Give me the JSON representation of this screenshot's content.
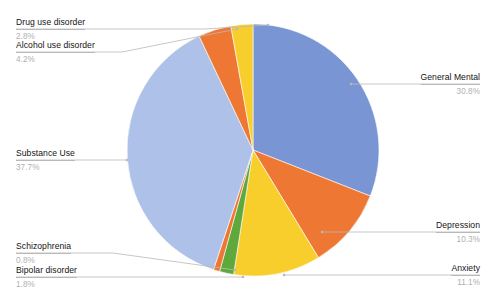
{
  "chart_data": {
    "type": "pie",
    "title": "",
    "subtitle": "",
    "xlabel": "",
    "ylabel": "",
    "legend_position": "callout-labels",
    "grid": false,
    "unit": "%",
    "start_angle_deg": 0,
    "direction": "clockwise",
    "categories": [
      "General Mental",
      "Depression",
      "Anxiety",
      "Bipolar disorder",
      "Schizophrenia",
      "Substance Use",
      "Alcohol use disorder",
      "Drug use disorder"
    ],
    "values": [
      30.8,
      10.3,
      11.1,
      1.8,
      0.8,
      37.7,
      4.2,
      2.8
    ],
    "colors": [
      "#7A95D4",
      "#EE7733",
      "#F7CE2C",
      "#5EA83C",
      "#EE7733",
      "#AEC1E8",
      "#EE7733",
      "#F7CE2C"
    ],
    "slices": [
      {
        "label": "General Mental",
        "value": 30.8,
        "percent_text": "30.8%",
        "color": "#7A95D4",
        "side": "right"
      },
      {
        "label": "Depression",
        "value": 10.3,
        "percent_text": "10.3%",
        "color": "#EE7733",
        "side": "right"
      },
      {
        "label": "Anxiety",
        "value": 11.1,
        "percent_text": "11.1%",
        "color": "#F7CE2C",
        "side": "right"
      },
      {
        "label": "Bipolar disorder",
        "value": 1.8,
        "percent_text": "1.8%",
        "color": "#5EA83C",
        "side": "left"
      },
      {
        "label": "Schizophrenia",
        "value": 0.8,
        "percent_text": "0.8%",
        "color": "#EE7733",
        "side": "left"
      },
      {
        "label": "Substance Use",
        "value": 37.7,
        "percent_text": "37.7%",
        "color": "#AEC1E8",
        "side": "left"
      },
      {
        "label": "Alcohol use disorder",
        "value": 4.2,
        "percent_text": "4.2%",
        "color": "#EE7733",
        "side": "left"
      },
      {
        "label": "Drug use disorder",
        "value": 2.8,
        "percent_text": "2.8%",
        "color": "#F7CE2C",
        "side": "left"
      }
    ]
  },
  "callouts": {
    "drug_use": {
      "name": "Drug use disorder",
      "percent": "2.8%"
    },
    "alcohol_use": {
      "name": "Alcohol use disorder",
      "percent": "4.2%"
    },
    "substance_use": {
      "name": "Substance Use",
      "percent": "37.7%"
    },
    "schizophrenia": {
      "name": "Schizophrenia",
      "percent": "0.8%"
    },
    "bipolar": {
      "name": "Bipolar disorder",
      "percent": "1.8%"
    },
    "general_mental": {
      "name": "General Mental",
      "percent": "30.8%"
    },
    "depression": {
      "name": "Depression",
      "percent": "10.3%"
    },
    "anxiety": {
      "name": "Anxiety",
      "percent": "11.1%"
    }
  }
}
